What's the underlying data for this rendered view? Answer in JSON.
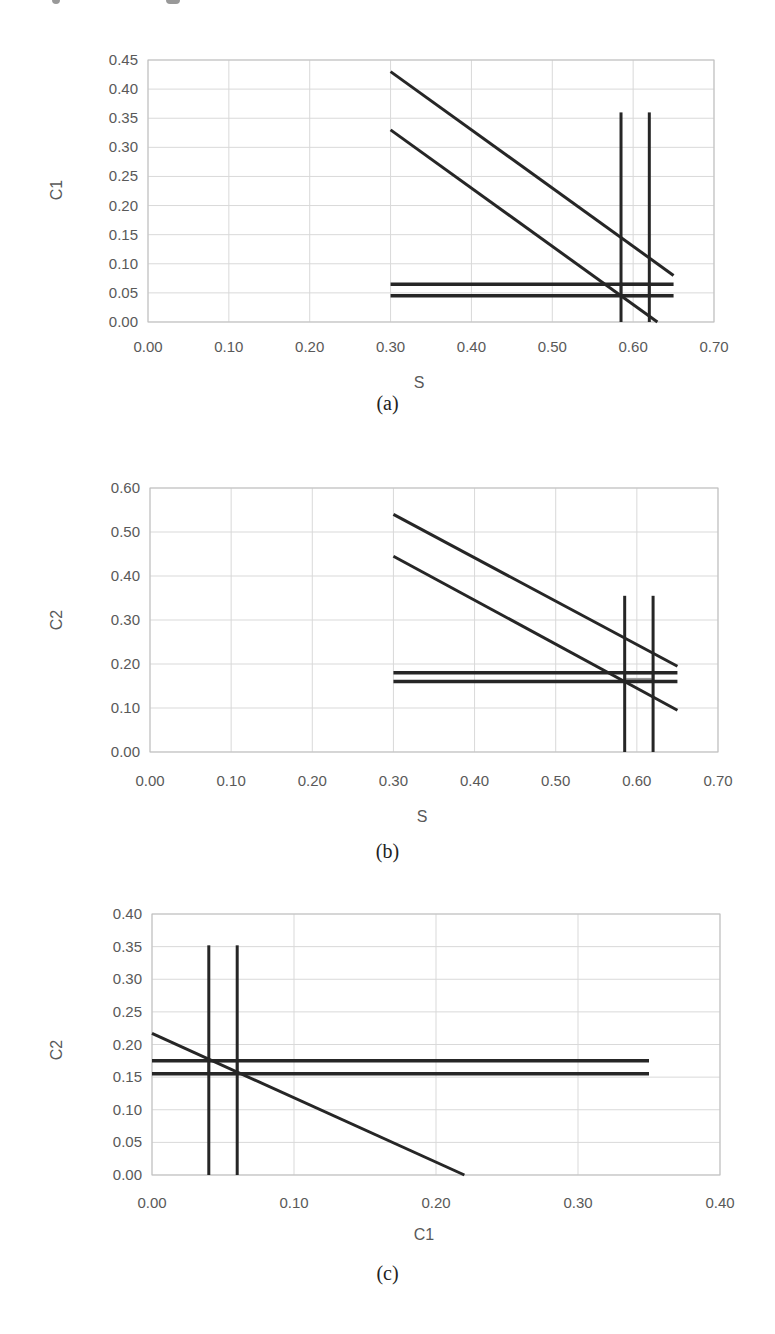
{
  "figure": {
    "panels": [
      {
        "id": "a",
        "caption": "(a)"
      },
      {
        "id": "b",
        "caption": "(b)"
      },
      {
        "id": "c",
        "caption": "(c)"
      }
    ]
  },
  "chart_data": [
    {
      "type": "line",
      "panel": "(a)",
      "title": "",
      "xlabel": "S",
      "ylabel": "C1",
      "xlim": [
        0.0,
        0.7
      ],
      "ylim": [
        0.0,
        0.45
      ],
      "xticks": [
        "0.00",
        "0.10",
        "0.20",
        "0.30",
        "0.40",
        "0.50",
        "0.60",
        "0.70"
      ],
      "yticks": [
        "0.00",
        "0.05",
        "0.10",
        "0.15",
        "0.20",
        "0.25",
        "0.30",
        "0.35",
        "0.40",
        "0.45"
      ],
      "grid": true,
      "legend": null,
      "series": [
        {
          "name": "upper diagonal",
          "x": [
            0.3,
            0.65
          ],
          "y": [
            0.43,
            0.08
          ]
        },
        {
          "name": "lower diagonal",
          "x": [
            0.3,
            0.63
          ],
          "y": [
            0.33,
            0.0
          ]
        },
        {
          "name": "vertical S=0.585",
          "x": [
            0.585,
            0.585
          ],
          "y": [
            0.0,
            0.36
          ]
        },
        {
          "name": "vertical S=0.62",
          "x": [
            0.62,
            0.62
          ],
          "y": [
            0.0,
            0.36
          ]
        },
        {
          "name": "horizontal C1=0.065",
          "x": [
            0.3,
            0.65
          ],
          "y": [
            0.065,
            0.065
          ]
        },
        {
          "name": "horizontal C1=0.045",
          "x": [
            0.3,
            0.65
          ],
          "y": [
            0.045,
            0.045
          ]
        }
      ],
      "feasible_region": {
        "x": [
          0.585,
          0.62
        ],
        "y": [
          0.045,
          0.065
        ],
        "color": "#9a9a9a"
      }
    },
    {
      "type": "line",
      "panel": "(b)",
      "title": "",
      "xlabel": "S",
      "ylabel": "C2",
      "xlim": [
        0.0,
        0.7
      ],
      "ylim": [
        0.0,
        0.6
      ],
      "xticks": [
        "0.00",
        "0.10",
        "0.20",
        "0.30",
        "0.40",
        "0.50",
        "0.60",
        "0.70"
      ],
      "yticks": [
        "0.00",
        "0.10",
        "0.20",
        "0.30",
        "0.40",
        "0.50",
        "0.60"
      ],
      "grid": true,
      "legend": null,
      "series": [
        {
          "name": "upper diagonal",
          "x": [
            0.3,
            0.65
          ],
          "y": [
            0.54,
            0.195
          ]
        },
        {
          "name": "lower diagonal",
          "x": [
            0.3,
            0.65
          ],
          "y": [
            0.445,
            0.095
          ]
        },
        {
          "name": "vertical S=0.585",
          "x": [
            0.585,
            0.585
          ],
          "y": [
            0.0,
            0.355
          ]
        },
        {
          "name": "vertical S=0.62",
          "x": [
            0.62,
            0.62
          ],
          "y": [
            0.0,
            0.355
          ]
        },
        {
          "name": "horizontal C2=0.18",
          "x": [
            0.3,
            0.65
          ],
          "y": [
            0.18,
            0.18
          ]
        },
        {
          "name": "horizontal C2=0.16",
          "x": [
            0.3,
            0.65
          ],
          "y": [
            0.16,
            0.16
          ]
        }
      ],
      "feasible_region": {
        "x": [
          0.585,
          0.62
        ],
        "y": [
          0.165,
          0.18
        ],
        "color": "#9a9a9a"
      }
    },
    {
      "type": "line",
      "panel": "(c)",
      "title": "",
      "xlabel": "C1",
      "ylabel": "C2",
      "xlim": [
        0.0,
        0.4
      ],
      "ylim": [
        0.0,
        0.4
      ],
      "xticks": [
        "0.00",
        "0.10",
        "0.20",
        "0.30",
        "0.40"
      ],
      "yticks": [
        "0.00",
        "0.05",
        "0.10",
        "0.15",
        "0.20",
        "0.25",
        "0.30",
        "0.35",
        "0.40"
      ],
      "grid": true,
      "legend": null,
      "series": [
        {
          "name": "diagonal",
          "x": [
            0.0,
            0.22
          ],
          "y": [
            0.217,
            0.0
          ]
        },
        {
          "name": "vertical C1=0.04",
          "x": [
            0.04,
            0.04
          ],
          "y": [
            0.0,
            0.352
          ]
        },
        {
          "name": "vertical C1=0.06",
          "x": [
            0.06,
            0.06
          ],
          "y": [
            0.0,
            0.352
          ]
        },
        {
          "name": "horizontal C2=0.175",
          "x": [
            0.0,
            0.35
          ],
          "y": [
            0.175,
            0.175
          ]
        },
        {
          "name": "horizontal C2=0.155",
          "x": [
            0.0,
            0.35
          ],
          "y": [
            0.155,
            0.155
          ]
        }
      ],
      "feasible_region": {
        "x": [
          0.04,
          0.06
        ],
        "y": [
          0.155,
          0.175
        ],
        "color": "#9a9a9a"
      }
    }
  ]
}
